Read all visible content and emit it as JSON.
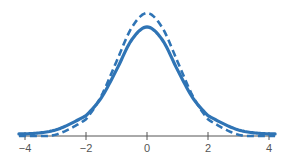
{
  "chart_data": {
    "type": "line",
    "title": "",
    "xlabel": "",
    "ylabel": "",
    "xlim": [
      -4.2,
      4.2
    ],
    "ylim": [
      0,
      0.42
    ],
    "x_ticks": [
      -4,
      -2,
      0,
      2,
      4
    ],
    "x_tick_labels": [
      "−4",
      "−2",
      "0",
      "2",
      "4"
    ],
    "grid": false,
    "legend": null,
    "y_axis_shown": false,
    "values_note": "No y-axis is shown. The y-values are estimated by measuring pixel heights and scaling them so the dashed curve's peak equals 0.399. That scaling is an assumption and does not come from the image.",
    "series": [
      {
        "name": "dashed curve (taller, narrower peak, lighter tails)",
        "style": "dashed",
        "color": "#2f74b5",
        "x": [
          -4,
          -3,
          -2,
          -1.5,
          -1,
          -0.5,
          0,
          0.5,
          1,
          1.5,
          2,
          3,
          4
        ],
        "y": [
          0.0001,
          0.0044,
          0.054,
          0.1295,
          0.242,
          0.352,
          0.399,
          0.352,
          0.242,
          0.1295,
          0.054,
          0.0044,
          0.0001
        ]
      },
      {
        "name": "solid curve (lower peak, heavier tails)",
        "style": "solid",
        "color": "#2f74b5",
        "x": [
          -4,
          -3,
          -2,
          -1.5,
          -1,
          -0.5,
          0,
          0.5,
          1,
          1.5,
          2,
          3,
          4
        ],
        "y": [
          0.0066,
          0.0197,
          0.066,
          0.124,
          0.2147,
          0.3125,
          0.354,
          0.3125,
          0.2147,
          0.124,
          0.066,
          0.0197,
          0.0066
        ]
      }
    ]
  },
  "colors": {
    "curve": "#2f74b5",
    "axis": "#555555",
    "background": "#ffffff"
  },
  "layout": {
    "x_origin_px": 147,
    "px_per_x_unit": 30.5,
    "baseline_px": 136,
    "px_per_y_unit": 308
  }
}
